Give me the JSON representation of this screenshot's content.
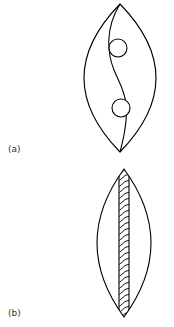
{
  "figure": {
    "panels": [
      {
        "id": "a",
        "label": "(a)",
        "description": "Lens-shaped outline with an S-curve dividing line from top to bottom apex and two small circles along the curve"
      },
      {
        "id": "b",
        "label": "(b)",
        "description": "Lens-shaped outline with a vertical hatched band running from top to bottom apex"
      }
    ],
    "stroke_color": "#000000",
    "background": "#ffffff"
  }
}
